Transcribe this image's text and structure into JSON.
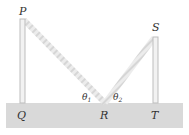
{
  "diagram": {
    "points": {
      "P": {
        "label": "P"
      },
      "Q": {
        "label": "Q"
      },
      "R": {
        "label": "R"
      },
      "S": {
        "label": "S"
      },
      "T": {
        "label": "T"
      }
    },
    "angles": {
      "theta1": {
        "symbol": "θ",
        "sub": "1"
      },
      "theta2": {
        "symbol": "θ",
        "sub": "2"
      }
    },
    "colors": {
      "ground": "#d9d9d9",
      "pole": "#c8c8c8",
      "beam": "#e4e4e4",
      "label": "#333333"
    }
  }
}
